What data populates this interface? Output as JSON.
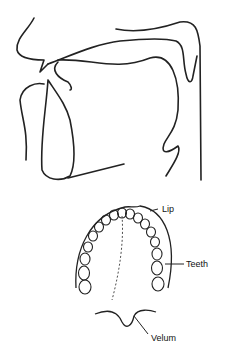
{
  "diagram": {
    "sagittal_view": {
      "description": "Midsagittal profile of vocal tract"
    },
    "palate_view": {
      "labels": {
        "lip": "Lip",
        "teeth": "Teeth",
        "velum": "Velum"
      }
    }
  },
  "colors": {
    "ink": "#222222",
    "background": "#ffffff"
  }
}
